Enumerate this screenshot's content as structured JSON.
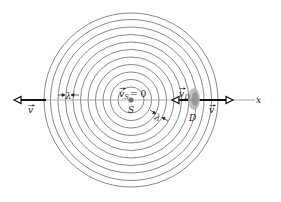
{
  "diagram": {
    "type": "doppler-wavefronts",
    "center": {
      "x": 131,
      "y": 100
    },
    "ring_radii": [
      13,
      20.5,
      28,
      35.5,
      43,
      50.5,
      58,
      65.5,
      73,
      80.5,
      87
    ],
    "ring_color": "#8a8a8a",
    "axis_color": "#888888",
    "arrow_color": "#111111",
    "detector_color": "#9a9a9a"
  },
  "labels": {
    "source_velocity": "v",
    "source_velocity_sub": "S",
    "source_velocity_eq": "= 0",
    "source": "S",
    "detector": "D",
    "detector_velocity": "v",
    "detector_velocity_sub": "D",
    "wave_velocity_left": "v",
    "wave_velocity_right": "v",
    "wavelength_left": "λ",
    "wavelength_diag": "λ",
    "axis": "x"
  }
}
